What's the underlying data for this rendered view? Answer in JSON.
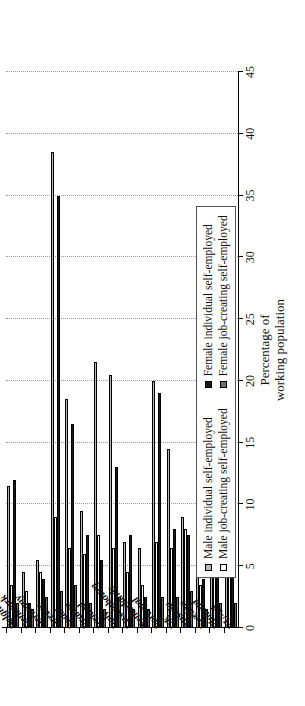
{
  "chart_data": {
    "type": "bar",
    "title": "",
    "subtitle": "",
    "xlabel": "",
    "ylabel": "Percentage of working population",
    "ylabel_line1": "Percentage of",
    "ylabel_line2": "working population",
    "orientation": "vertical-grouped-rotated",
    "ylim": [
      0,
      45
    ],
    "ticks": [
      "0",
      "5",
      "10",
      "15",
      "20",
      "25",
      "30",
      "35",
      "40",
      "45"
    ],
    "tick_values": [
      0,
      5,
      10,
      15,
      20,
      25,
      30,
      35,
      40,
      45
    ],
    "grid": true,
    "grid_style": "dotted",
    "legend_position": "inside-bottom-left",
    "categories": [
      "Belgium",
      "Denmark",
      "Germany",
      "Greece",
      "Spain",
      "France",
      "Ireland",
      "Italy",
      "Luxembourg",
      "Netherlands",
      "Portugal",
      "UK",
      "Austria",
      "Sweden",
      "Finland",
      "EU-15"
    ],
    "series": [
      {
        "name": "Male individual self-employed",
        "color": "#b8b8b8",
        "values": [
          11.5,
          4.5,
          5.5,
          38.5,
          18.5,
          9.5,
          21.5,
          20.5,
          7.0,
          6.5,
          20.0,
          14.5,
          9.0,
          7.5,
          16.0,
          13.5
        ]
      },
      {
        "name": "Male job-creating self-employed",
        "color": "#ffffff",
        "values": [
          3.5,
          3.0,
          4.5,
          9.0,
          6.5,
          6.0,
          7.5,
          6.5,
          4.5,
          3.5,
          7.0,
          6.5,
          8.0,
          3.5,
          5.5,
          6.0
        ]
      },
      {
        "name": "Female individual self-employed",
        "color": "#1a1a1a",
        "values": [
          12.0,
          2.0,
          4.0,
          35.0,
          16.5,
          7.5,
          5.5,
          13.0,
          7.5,
          2.5,
          19.0,
          8.0,
          7.5,
          4.0,
          11.0,
          10.5
        ]
      },
      {
        "name": "Female job-creating self-employed",
        "color": "#6e6e6e",
        "values": [
          2.0,
          1.5,
          2.5,
          3.0,
          3.5,
          2.0,
          1.5,
          2.5,
          1.5,
          1.5,
          2.5,
          2.5,
          3.0,
          1.5,
          2.0,
          2.0
        ]
      }
    ],
    "legend": [
      {
        "label": "Male individual self-employed",
        "color": "#b8b8b8",
        "swatch": "s0"
      },
      {
        "label": "Female individual self-employed",
        "color": "#1a1a1a",
        "swatch": "s2"
      },
      {
        "label": "Male job-creating self-employed",
        "color": "#ffffff",
        "swatch": "s1"
      },
      {
        "label": "Female job-creating self-employed",
        "color": "#6e6e6e",
        "swatch": "s3"
      }
    ]
  }
}
